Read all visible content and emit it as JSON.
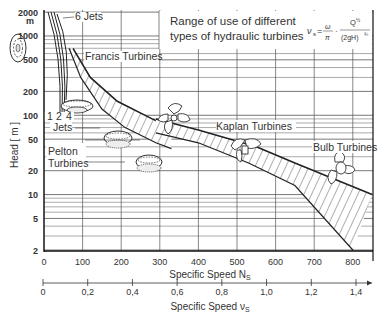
{
  "chart_data": {
    "type": "area",
    "title_lines": [
      "Range of use of different",
      "types of hydraulic turbines"
    ],
    "formula": {
      "lhs": "ν",
      "lhs_sub": "s",
      "eq": "=",
      "num1": "ω",
      "den1": "π",
      "num2": "Q",
      "den2": "(2gH)",
      "exp_num2": "½",
      "exp_den1": "½",
      "exp_den2": "¾"
    },
    "xlabel": "Specific Speed N",
    "xlabel_sub": "S",
    "x2label": "Specific Speed ν",
    "x2label_sub": "S",
    "ylabel": "Head [ m ]",
    "y_unit_label": "m",
    "y_scale": "log",
    "xlim": [
      0,
      850
    ],
    "ylim": [
      2,
      2000
    ],
    "grid": true,
    "x_ticks": [
      0,
      100,
      200,
      300,
      400,
      500,
      600,
      700,
      800
    ],
    "x_tick_labels": [
      "0",
      "100",
      "200",
      "300",
      "400",
      "500",
      "600",
      "700",
      "800"
    ],
    "y_ticks": [
      2,
      5,
      10,
      20,
      50,
      100,
      200,
      500,
      1000,
      2000
    ],
    "y_tick_labels": [
      "2",
      "5",
      "10",
      "20",
      "50",
      "100",
      "200",
      "500",
      "1000",
      "2000"
    ],
    "x2_ticks": [
      0,
      0.2,
      0.4,
      0.6,
      0.8,
      1.0,
      1.2,
      1.4
    ],
    "x2_tick_labels": [
      "0",
      "0,2",
      "0,4",
      "0,6",
      "0,8",
      "1,0",
      "1,2",
      "1,4"
    ],
    "series": [
      {
        "name": "Pelton Turbines",
        "label": "Pelton Turbines",
        "jets_label": "Jets",
        "jets": [
          "1",
          "2",
          "4"
        ],
        "top_label": "6 Jets",
        "boundary_left": [
          [
            5,
            2000
          ],
          [
            12,
            1000
          ],
          [
            15,
            500
          ],
          [
            15,
            100
          ]
        ],
        "boundary_right": [
          [
            12,
            2000
          ],
          [
            25,
            1000
          ],
          [
            30,
            500
          ],
          [
            30,
            100
          ]
        ]
      },
      {
        "name": "Francis Turbines",
        "label": "Francis Turbines",
        "upper": [
          [
            75,
            700
          ],
          [
            120,
            300
          ],
          [
            190,
            150
          ],
          [
            280,
            90
          ],
          [
            330,
            70
          ]
        ],
        "lower": [
          [
            65,
            700
          ],
          [
            95,
            300
          ],
          [
            150,
            120
          ],
          [
            210,
            70
          ],
          [
            290,
            45
          ],
          [
            330,
            38
          ]
        ]
      },
      {
        "name": "Kaplan Turbines",
        "label": "Kaplan Turbines",
        "upper": [
          [
            290,
            90
          ],
          [
            400,
            65
          ],
          [
            550,
            40
          ],
          [
            650,
            25
          ],
          [
            850,
            10
          ]
        ],
        "lower": [
          [
            290,
            60
          ],
          [
            400,
            45
          ],
          [
            530,
            25
          ],
          [
            650,
            13
          ],
          [
            800,
            2
          ]
        ]
      },
      {
        "name": "Bulb Turbines",
        "label": "Bulb Turbines",
        "upper": [
          [
            800,
            12
          ],
          [
            850,
            10
          ]
        ],
        "lower": [
          [
            800,
            2
          ],
          [
            850,
            4
          ]
        ]
      }
    ]
  }
}
